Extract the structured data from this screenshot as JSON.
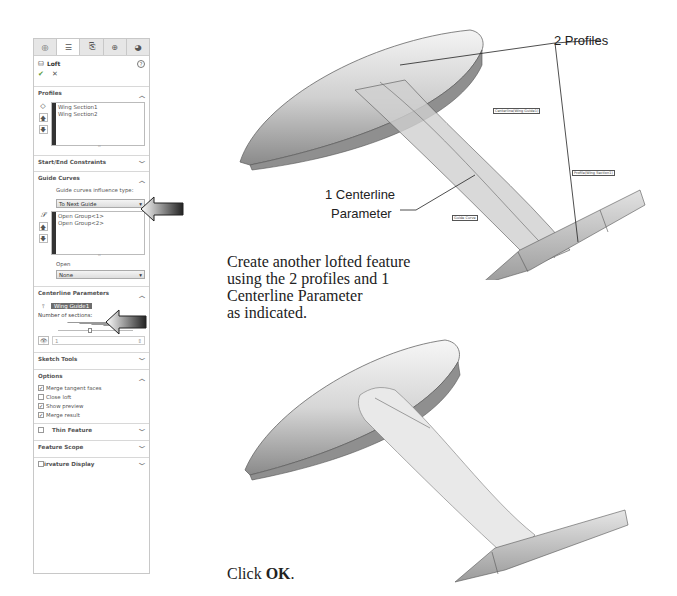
{
  "property_manager": {
    "tabs": [
      {
        "icon": "feature-manager-icon",
        "glyph": "◎"
      },
      {
        "icon": "property-manager-icon",
        "glyph": "☰"
      },
      {
        "icon": "configuration-manager-icon",
        "glyph": "⎘"
      },
      {
        "icon": "dimxpert-icon",
        "glyph": "⊕"
      },
      {
        "icon": "display-manager-icon",
        "glyph": "◕"
      }
    ],
    "title": "Loft",
    "help": "?",
    "ok": "✔",
    "cancel": "✕",
    "profiles": {
      "title": "Profiles",
      "items": [
        "Wing Section1",
        "Wing Section2"
      ]
    },
    "start_end": {
      "title": "Start/End Constraints"
    },
    "guide_curves": {
      "title": "Guide Curves",
      "influence_label": "Guide curves influence type:",
      "influence_value": "To Next Guide",
      "items": [
        "Open Group<1>",
        "Open Group<2>"
      ],
      "open_label": "Open",
      "open_value": "None"
    },
    "centerline": {
      "title": "Centerline Parameters",
      "selected": "Wing Guide1",
      "sections_label": "Number of sections:",
      "sections_value": "1"
    },
    "sketch_tools": {
      "title": "Sketch Tools"
    },
    "options": {
      "title": "Options",
      "checks": [
        {
          "label": "Merge tangent faces",
          "checked": true
        },
        {
          "label": "Close loft",
          "checked": false
        },
        {
          "label": "Show preview",
          "checked": true
        },
        {
          "label": "Merge result",
          "checked": true
        }
      ]
    },
    "thin_feature": {
      "title": "Thin Feature"
    },
    "feature_scope": {
      "title": "Feature Scope"
    },
    "curvature_display": {
      "title": "Curvature Display",
      "visible_text": "irvature Display"
    }
  },
  "annotations": {
    "profiles_callout": "2 Profiles",
    "centerline_callout_line1": "1 Centerline",
    "centerline_callout_line2": "Parameter",
    "tag_centerline": "Centerline(Wing Guide1)",
    "tag_profile": "Profile(Wing Section1)",
    "tag_guide": "Guide Curve"
  },
  "instructions": {
    "line1": "Create another lofted feature",
    "line2": "using the 2 profiles and 1",
    "line3": "Centerline Parameter",
    "line4": "as indicated.",
    "click_prefix": "Click ",
    "click_bold": "OK",
    "click_suffix": "."
  }
}
